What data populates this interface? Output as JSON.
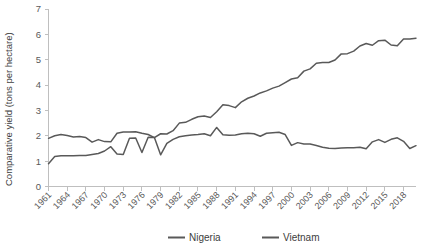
{
  "chart_data": {
    "type": "line",
    "title": "",
    "xlabel": "",
    "ylabel": "Comparative yield (tons per hectare)",
    "ylim": [
      0,
      7
    ],
    "yticks": [
      0,
      1,
      2,
      3,
      4,
      5,
      6,
      7
    ],
    "ytick_labels": [
      "0",
      "1",
      "2",
      "3",
      "4",
      "5",
      "6",
      "7"
    ],
    "xlim": [
      1961,
      2020
    ],
    "xticks": [
      1961,
      1964,
      1967,
      1970,
      1973,
      1976,
      1979,
      1982,
      1985,
      1988,
      1991,
      1994,
      1997,
      2000,
      2003,
      2006,
      2009,
      2012,
      2015,
      2018
    ],
    "xtick_labels": [
      "1961",
      "1964",
      "1967",
      "1970",
      "1973",
      "1976",
      "1979",
      "1982",
      "1985",
      "1988",
      "1991",
      "1994",
      "1997",
      "2000",
      "2003",
      "2006",
      "2009",
      "2012",
      "2015",
      "2018"
    ],
    "grid": false,
    "legend_position": "bottom",
    "x": [
      1961,
      1962,
      1963,
      1964,
      1965,
      1966,
      1967,
      1968,
      1969,
      1970,
      1971,
      1972,
      1973,
      1974,
      1975,
      1976,
      1977,
      1978,
      1979,
      1980,
      1981,
      1982,
      1983,
      1984,
      1985,
      1986,
      1987,
      1988,
      1989,
      1990,
      1991,
      1992,
      1993,
      1994,
      1995,
      1996,
      1997,
      1998,
      1999,
      2000,
      2001,
      2002,
      2003,
      2004,
      2005,
      2006,
      2007,
      2008,
      2009,
      2010,
      2011,
      2012,
      2013,
      2014,
      2015,
      2016,
      2017,
      2018,
      2019,
      2020
    ],
    "series": [
      {
        "name": "Nigeria",
        "color": "#595959",
        "values": [
          0.9,
          1.18,
          1.21,
          1.21,
          1.21,
          1.22,
          1.22,
          1.26,
          1.3,
          1.4,
          1.57,
          1.28,
          1.26,
          1.9,
          1.91,
          1.34,
          1.94,
          1.93,
          1.25,
          1.7,
          1.86,
          1.96,
          2.0,
          2.03,
          2.05,
          2.08,
          2.0,
          2.33,
          2.04,
          2.02,
          2.03,
          2.08,
          2.1,
          2.08,
          1.98,
          2.1,
          2.12,
          2.14,
          2.05,
          1.62,
          1.73,
          1.68,
          1.68,
          1.62,
          1.55,
          1.51,
          1.5,
          1.52,
          1.53,
          1.53,
          1.55,
          1.49,
          1.76,
          1.85,
          1.74,
          1.86,
          1.92,
          1.78,
          1.5,
          1.61
        ]
      },
      {
        "name": "Vietnam",
        "color": "#595959",
        "values": [
          1.9,
          2.0,
          2.05,
          2.01,
          1.95,
          1.97,
          1.93,
          1.75,
          1.85,
          1.77,
          1.76,
          2.1,
          2.15,
          2.15,
          2.16,
          2.1,
          2.05,
          1.93,
          2.08,
          2.07,
          2.2,
          2.5,
          2.53,
          2.65,
          2.75,
          2.78,
          2.72,
          2.95,
          3.22,
          3.19,
          3.11,
          3.34,
          3.48,
          3.57,
          3.69,
          3.77,
          3.88,
          3.96,
          4.1,
          4.24,
          4.29,
          4.55,
          4.64,
          4.86,
          4.89,
          4.89,
          4.99,
          5.23,
          5.24,
          5.34,
          5.54,
          5.64,
          5.57,
          5.75,
          5.77,
          5.58,
          5.55,
          5.82,
          5.82,
          5.85
        ]
      }
    ]
  },
  "legend": {
    "items": [
      {
        "label": "Nigeria",
        "color": "#595959"
      },
      {
        "label": "Vietnam",
        "color": "#595959"
      }
    ]
  },
  "axis": {
    "y_title": "Comparative yield (tons per hectare)"
  }
}
